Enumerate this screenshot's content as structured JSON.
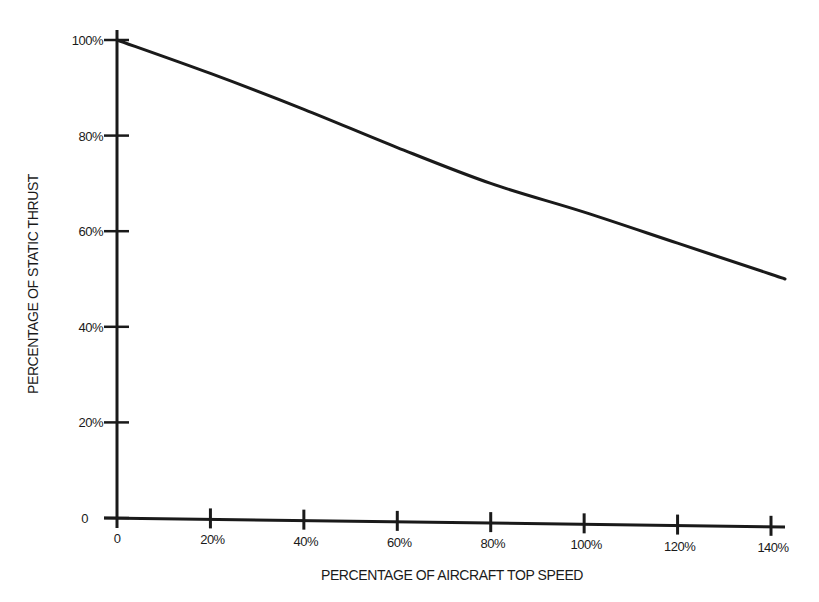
{
  "chart_data": {
    "type": "line",
    "title": "",
    "xlabel": "PERCENTAGE OF AIRCRAFT TOP SPEED",
    "ylabel": "PERCENTAGE OF STATIC THRUST",
    "x_tick_labels": [
      "0",
      "20%",
      "40%",
      "60%",
      "80%",
      "100%",
      "120%",
      "140%"
    ],
    "y_tick_labels": [
      "0",
      "20%",
      "40%",
      "60%",
      "80%",
      "100%"
    ],
    "xlim": [
      0,
      145
    ],
    "ylim": [
      0,
      100
    ],
    "grid": false,
    "legend": null,
    "series": [
      {
        "name": "Static thrust vs. airspeed",
        "x": [
          0,
          20,
          40,
          60,
          80,
          100,
          120,
          140,
          143
        ],
        "values": [
          100,
          93,
          85.5,
          77.5,
          70,
          64,
          57.5,
          51,
          50
        ]
      }
    ]
  }
}
